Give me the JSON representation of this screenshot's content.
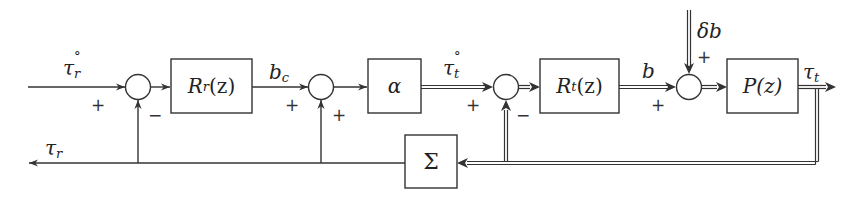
{
  "diagram": {
    "type": "control-block-diagram",
    "blocks": {
      "rr": {
        "label": "R",
        "sub": "r",
        "suffix": "(z)"
      },
      "alpha": {
        "label": "α"
      },
      "rt": {
        "label": "R",
        "sub": "t",
        "suffix": "(z)"
      },
      "p": {
        "label": "P(z)"
      },
      "sigma": {
        "label": "Σ"
      }
    },
    "signals": {
      "tau_r_ref": {
        "main": "τ",
        "sub": "r",
        "sup": "°"
      },
      "b_c": {
        "main": "b",
        "sub": "c"
      },
      "tau_t_ref": {
        "main": "τ",
        "sub": "t",
        "sup": "°"
      },
      "b": {
        "main": "b"
      },
      "delta_b": {
        "main": "δb"
      },
      "tau_t": {
        "main": "τ",
        "sub": "t"
      },
      "tau_r": {
        "main": "τ",
        "sub": "r"
      }
    },
    "signs": {
      "s1_in": "+",
      "s1_fb": "−",
      "s2_in": "+",
      "s2_fb": "+",
      "s3_in": "+",
      "s3_fb": "−",
      "s4_in": "+",
      "s4_top": "+"
    },
    "colors": {
      "line": "#333333",
      "text": "#222222"
    }
  }
}
